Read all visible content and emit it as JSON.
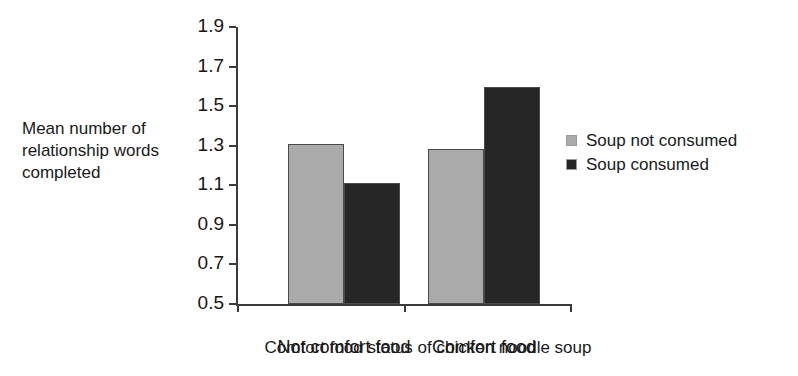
{
  "chart_data": {
    "type": "bar",
    "title": "",
    "subtitle": "",
    "xlabel": "Comfort food status of chicken noodle soup",
    "ylabel": "Mean number of relationship words completed",
    "ylabel_lines": [
      "Mean number of",
      "relationship words",
      "completed"
    ],
    "categories": [
      "Not comfort food",
      "Comfort food"
    ],
    "series": [
      {
        "name": "Soup not consumed",
        "color": "#aaaaaa",
        "values": [
          1.31,
          1.285
        ]
      },
      {
        "name": "Soup consumed",
        "color": "#262626",
        "values": [
          1.11,
          1.595
        ]
      }
    ],
    "ylim": [
      0.5,
      1.9
    ],
    "ytick_labels": [
      "1.9",
      "1.7",
      "1.5",
      "1.3",
      "1.1",
      "0.9",
      "0.7",
      "0.5"
    ],
    "ytick_values": [
      1.9,
      1.7,
      1.5,
      1.3,
      1.1,
      0.9,
      0.7,
      0.5
    ],
    "ytick_step": 0.2,
    "grid": false,
    "legend_position": "right",
    "axis_color": "#3b3b3b",
    "bar_edge_color": "#4a4a4a"
  },
  "legend": {
    "entries": [
      {
        "label": "Soup not consumed",
        "color": "#aaaaaa"
      },
      {
        "label": "Soup consumed",
        "color": "#262626"
      }
    ]
  }
}
